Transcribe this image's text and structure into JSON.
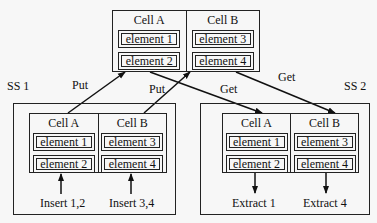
{
  "top": {
    "cells": [
      {
        "title": "Cell A",
        "elements": [
          "element 1",
          "element 2"
        ]
      },
      {
        "title": "Cell B",
        "elements": [
          "element 3",
          "element 4"
        ]
      }
    ]
  },
  "ss1": {
    "label": "SS 1",
    "cells": [
      {
        "title": "Cell A",
        "elements": [
          "element 1",
          "element 2"
        ],
        "action": "Insert 1,2"
      },
      {
        "title": "Cell B",
        "elements": [
          "element 3",
          "element 4"
        ],
        "action": "Insert  3,4"
      }
    ]
  },
  "ss2": {
    "label": "SS 2",
    "cells": [
      {
        "title": "Cell A",
        "elements": [
          "element 1",
          "element 2"
        ],
        "action": "Extract  1"
      },
      {
        "title": "Cell B",
        "elements": [
          "element 3",
          "element 4"
        ],
        "action": "Extract 4"
      }
    ]
  },
  "arrows": {
    "put1": "Put",
    "put2": "Put",
    "get1": "Get",
    "get2": "Get"
  }
}
